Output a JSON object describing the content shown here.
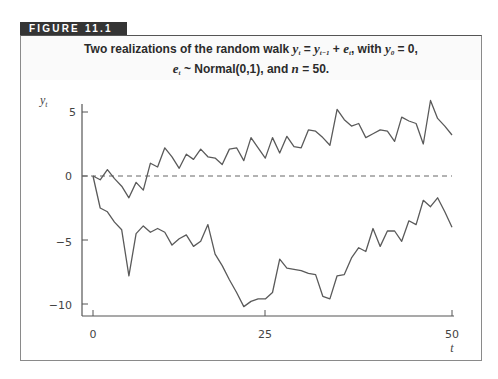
{
  "figure": {
    "label": "FIGURE 11.1",
    "caption_line1_prefix": "Two realizations of the random walk ",
    "caption_line1_eq": "y",
    "caption_line1_rest": ", with ",
    "caption_line2": "Normal(0,1), and n = 50.",
    "caption_full": "Two realizations of the random walk y_t = y_{t-1} + e_t, with y_0 = 0, e_t ~ Normal(0,1), and n = 50."
  },
  "chart_data": {
    "type": "line",
    "xlabel": "t",
    "ylabel": "y_t",
    "xlim": [
      0,
      50
    ],
    "ylim": [
      -11,
      6
    ],
    "xticks": [
      0,
      25,
      50
    ],
    "yticks": [
      -10,
      -5,
      0,
      5
    ],
    "grid": false,
    "legend": "none",
    "reference_line": {
      "y": 0,
      "style": "dashed"
    },
    "series": [
      {
        "name": "realization 1 (upper)",
        "x": [
          0,
          1,
          2,
          3,
          4,
          5,
          6,
          7,
          8,
          9,
          10,
          11,
          12,
          13,
          14,
          15,
          16,
          17,
          18,
          19,
          20,
          21,
          22,
          23,
          24,
          25,
          26,
          27,
          28,
          29,
          30,
          31,
          32,
          33,
          34,
          35,
          36,
          37,
          38,
          39,
          40,
          41,
          42,
          43,
          44,
          45,
          46,
          47,
          48,
          49,
          50
        ],
        "values": [
          0,
          -0.3,
          0.5,
          -0.2,
          -0.8,
          -1.7,
          -0.5,
          -1.1,
          1.0,
          0.7,
          2.2,
          1.5,
          0.6,
          1.7,
          1.3,
          2.1,
          1.5,
          1.4,
          0.9,
          2.1,
          2.2,
          1.2,
          3.0,
          2.2,
          1.4,
          3.0,
          1.8,
          3.1,
          2.3,
          2.2,
          3.6,
          3.5,
          3.0,
          2.4,
          5.2,
          4.4,
          3.9,
          4.1,
          3.0,
          3.3,
          3.6,
          3.5,
          2.7,
          4.6,
          4.3,
          4.1,
          2.5,
          5.9,
          4.5,
          3.9,
          3.2
        ]
      },
      {
        "name": "realization 2 (lower)",
        "x": [
          0,
          1,
          2,
          3,
          4,
          5,
          6,
          7,
          8,
          9,
          10,
          11,
          12,
          13,
          14,
          15,
          16,
          17,
          18,
          19,
          20,
          21,
          22,
          23,
          24,
          25,
          26,
          27,
          28,
          29,
          30,
          31,
          32,
          33,
          34,
          35,
          36,
          37,
          38,
          39,
          40,
          41,
          42,
          43,
          44,
          45,
          46,
          47,
          48,
          49,
          50
        ],
        "values": [
          0,
          -2.5,
          -2.8,
          -3.6,
          -4.2,
          -7.8,
          -4.5,
          -3.9,
          -4.4,
          -4.1,
          -4.4,
          -5.4,
          -4.9,
          -4.6,
          -5.5,
          -5.1,
          -3.8,
          -6.1,
          -7.0,
          -8.1,
          -9.1,
          -10.2,
          -9.8,
          -9.6,
          -9.6,
          -9.1,
          -6.5,
          -7.2,
          -7.3,
          -7.4,
          -7.6,
          -7.7,
          -9.4,
          -9.6,
          -7.8,
          -7.7,
          -6.4,
          -5.6,
          -5.9,
          -4.1,
          -5.5,
          -4.3,
          -4.3,
          -5.1,
          -3.5,
          -3.8,
          -1.9,
          -2.4,
          -1.7,
          -2.8,
          -4.0
        ]
      }
    ],
    "tick_labels": {
      "x": [
        "0",
        "25",
        "50"
      ],
      "y": [
        "5",
        "0",
        "−5",
        "−10"
      ]
    }
  },
  "axes": {
    "x_label": "t",
    "y_label": "y",
    "y_label_sub": "t",
    "x_tick_0": "0",
    "x_tick_25": "25",
    "x_tick_50": "50",
    "y_tick_5": "5",
    "y_tick_0": "0",
    "y_tick_m5": "−5",
    "y_tick_m10": "−10"
  },
  "colors": {
    "line": "#5a5a5a",
    "axis": "#555555",
    "tab_bg": "#343434",
    "tab_text": "#ffffff"
  }
}
